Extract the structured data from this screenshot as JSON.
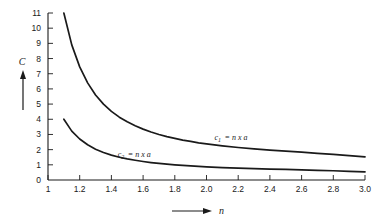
{
  "chart_data": {
    "type": "line",
    "title": "",
    "subtitle": "",
    "xlabel": "n",
    "ylabel": "C",
    "xlim": [
      1.0,
      3.0
    ],
    "ylim": [
      0,
      11
    ],
    "grid": false,
    "legend": "inline-curve-labels",
    "xticks": [
      1.0,
      1.2,
      1.4,
      1.6,
      1.8,
      2.0,
      2.2,
      2.4,
      2.6,
      2.8,
      3.0
    ],
    "xtick_labels": [
      "1",
      "1.2",
      "1.4",
      "1.6",
      "1.8",
      "2.0",
      "2.2",
      "2.4",
      "2.6",
      "2.8",
      "3.0"
    ],
    "yticks": [
      0,
      1,
      2,
      3,
      4,
      5,
      6,
      7,
      8,
      9,
      10,
      11
    ],
    "ytick_labels": [
      "0",
      "1",
      "2",
      "3",
      "4",
      "5",
      "6",
      "7",
      "8",
      "9",
      "10",
      "11"
    ],
    "x": [
      1.1,
      1.15,
      1.2,
      1.25,
      1.3,
      1.35,
      1.4,
      1.45,
      1.5,
      1.55,
      1.6,
      1.65,
      1.7,
      1.75,
      1.8,
      1.85,
      1.9,
      1.95,
      2.0,
      2.1,
      2.2,
      2.3,
      2.4,
      2.5,
      2.6,
      2.7,
      2.8,
      2.9,
      3.0
    ],
    "series": [
      {
        "name": "c1",
        "label_text": "= n x a",
        "label_base": "c",
        "label_subscript": "1",
        "label_x": 2.05,
        "label_y": 2.62,
        "values": [
          11.0,
          8.9,
          7.45,
          6.4,
          5.6,
          5.0,
          4.52,
          4.14,
          3.83,
          3.57,
          3.35,
          3.16,
          3.0,
          2.86,
          2.74,
          2.63,
          2.54,
          2.45,
          2.38,
          2.25,
          2.14,
          2.05,
          1.97,
          1.9,
          1.83,
          1.76,
          1.69,
          1.61,
          1.52
        ]
      },
      {
        "name": "c2",
        "label_text": "= n x a",
        "label_base": "c",
        "label_subscript": "2",
        "label_x": 1.44,
        "label_y": 1.5,
        "values": [
          4.0,
          3.22,
          2.7,
          2.32,
          2.03,
          1.81,
          1.64,
          1.5,
          1.39,
          1.3,
          1.22,
          1.15,
          1.09,
          1.04,
          1.0,
          0.96,
          0.93,
          0.9,
          0.87,
          0.82,
          0.78,
          0.75,
          0.72,
          0.7,
          0.67,
          0.64,
          0.61,
          0.57,
          0.53
        ]
      }
    ]
  },
  "axes": {
    "y_axis_name": "C",
    "x_axis_name": "n",
    "y_arrow_direction": "up",
    "x_arrow_direction": "right"
  },
  "colors": {
    "curve": "#1a1a1a",
    "axis": "#1a1a1a",
    "background": "#ffffff"
  }
}
